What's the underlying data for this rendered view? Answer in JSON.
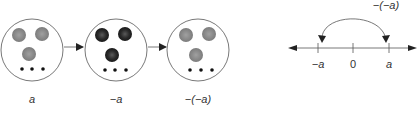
{
  "sets": [
    {
      "label": "a",
      "counter_color": "#8a8a8a",
      "counter_core": "#9a9a9a",
      "dots": 3
    },
    {
      "label": "−a",
      "counter_color": "#2b2b2b",
      "counter_core": "#555555",
      "dots": 3
    },
    {
      "label": "−(−a)",
      "counter_color": "#8a8a8a",
      "counter_core": "#9a9a9a",
      "dots": 3
    }
  ],
  "number_line": {
    "ticks": [
      {
        "label": "−a",
        "italic": true
      },
      {
        "label": "0",
        "italic": false
      },
      {
        "label": "a",
        "italic": true
      }
    ],
    "arc_label": "−(−a)"
  },
  "colors": {
    "stroke": "#555555",
    "arrow": "#222222",
    "text": "#333333"
  }
}
